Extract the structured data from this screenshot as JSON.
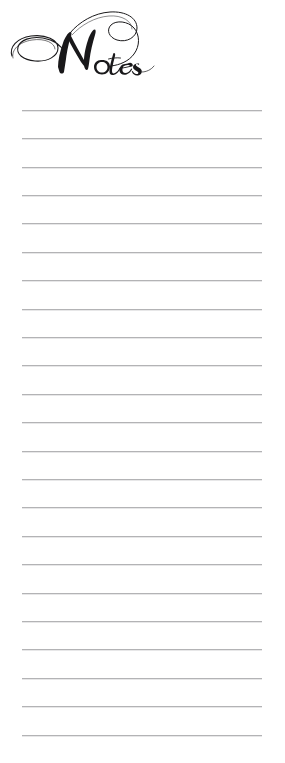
{
  "page": {
    "width": 285,
    "height": 763,
    "background_color": "#ffffff",
    "kind": "printable-notes-page"
  },
  "header": {
    "title": "Notes",
    "title_style": "ornate-calligraphic-script",
    "title_color": "#19181a",
    "flourish": "large-swash-loop-on-capital-N"
  },
  "note_area": {
    "label": "ruled-writing-lines",
    "line_color": "#b3b3b5",
    "line_count": 23,
    "line_left_px": 22,
    "line_right_px": 262,
    "first_line_y_px": 110,
    "line_spacing_px": 28.4,
    "lines": [
      {
        "index": 1,
        "y": 110,
        "text": ""
      },
      {
        "index": 2,
        "y": 138,
        "text": ""
      },
      {
        "index": 3,
        "y": 167,
        "text": ""
      },
      {
        "index": 4,
        "y": 195,
        "text": ""
      },
      {
        "index": 5,
        "y": 223,
        "text": ""
      },
      {
        "index": 6,
        "y": 252,
        "text": ""
      },
      {
        "index": 7,
        "y": 280,
        "text": ""
      },
      {
        "index": 8,
        "y": 309,
        "text": ""
      },
      {
        "index": 9,
        "y": 337,
        "text": ""
      },
      {
        "index": 10,
        "y": 365,
        "text": ""
      },
      {
        "index": 11,
        "y": 394,
        "text": ""
      },
      {
        "index": 12,
        "y": 422,
        "text": ""
      },
      {
        "index": 13,
        "y": 451,
        "text": ""
      },
      {
        "index": 14,
        "y": 479,
        "text": ""
      },
      {
        "index": 15,
        "y": 507,
        "text": ""
      },
      {
        "index": 16,
        "y": 536,
        "text": ""
      },
      {
        "index": 17,
        "y": 564,
        "text": ""
      },
      {
        "index": 18,
        "y": 593,
        "text": ""
      },
      {
        "index": 19,
        "y": 621,
        "text": ""
      },
      {
        "index": 20,
        "y": 649,
        "text": ""
      },
      {
        "index": 21,
        "y": 678,
        "text": ""
      },
      {
        "index": 22,
        "y": 706,
        "text": ""
      },
      {
        "index": 23,
        "y": 735,
        "text": ""
      }
    ]
  }
}
